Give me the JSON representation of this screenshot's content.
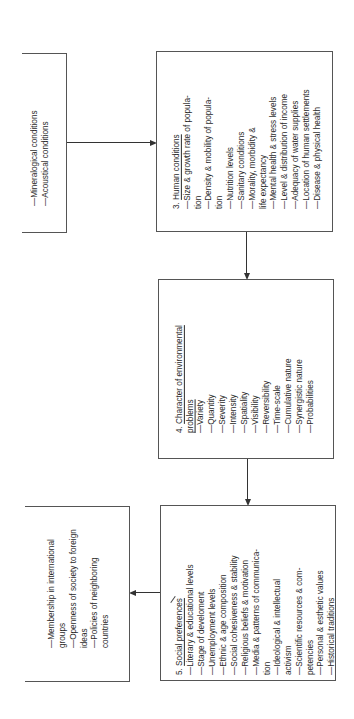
{
  "diagram": {
    "box_top_left": {
      "items": [
        "Mineralogical conditions",
        "Acoustical conditions"
      ]
    },
    "box3": {
      "number": "3.",
      "title": "Human conditions",
      "lines": [
        {
          "dash": true,
          "text": "Size & growth rate of popula-"
        },
        {
          "dash": false,
          "text": "tion"
        },
        {
          "dash": true,
          "text": "Density & mobility of popula-"
        },
        {
          "dash": false,
          "text": "tion"
        },
        {
          "dash": true,
          "text": "Nutrition levels"
        },
        {
          "dash": true,
          "text": "Sanitary conditions"
        },
        {
          "dash": true,
          "text": "Morality, morbidity &"
        },
        {
          "dash": false,
          "text": "life expectancy"
        },
        {
          "dash": true,
          "text": "Mental health & stress levels"
        },
        {
          "dash": true,
          "text": "Level & distribution of income"
        },
        {
          "dash": true,
          "text": "Adequacy of water supplies"
        },
        {
          "dash": true,
          "text": "Location of human settlements"
        },
        {
          "dash": true,
          "text": "Disease & physical health"
        }
      ]
    },
    "box4": {
      "number": "4.",
      "title_line1": "Character of environmental",
      "title_line2": "problems",
      "lines": [
        "Variety",
        "Quantity",
        "Severity",
        "Intensity",
        "Spatiality",
        "Visibility",
        "Reversibility",
        "Time-scale",
        "Cumulative nature",
        "Synergistic nature",
        "Probabilities"
      ]
    },
    "box5": {
      "number": "5.",
      "title": "Social preferences",
      "lines": [
        {
          "dash": true,
          "text": "Literary & educational levels"
        },
        {
          "dash": true,
          "text": "Stage of develoment"
        },
        {
          "dash": true,
          "text": "Unemployment levels"
        },
        {
          "dash": true,
          "text": "Ethnic & age composition"
        },
        {
          "dash": true,
          "text": "Social cohesiveness & stability"
        },
        {
          "dash": true,
          "text": "Religious beliefs & motivation"
        },
        {
          "dash": true,
          "text": "Media & patterns of communica-"
        },
        {
          "dash": false,
          "text": "tion"
        },
        {
          "dash": true,
          "text": "Ideological & intellectual"
        },
        {
          "dash": false,
          "text": "activism"
        },
        {
          "dash": true,
          "text": "Scientific resources & com-"
        },
        {
          "dash": false,
          "text": "petencies"
        },
        {
          "dash": true,
          "text": "Personal & esthetic values"
        },
        {
          "dash": true,
          "text": "Historical traditions"
        }
      ]
    },
    "box_bottom_left": {
      "lines": [
        {
          "dash": true,
          "text": "Membership in international"
        },
        {
          "dash": false,
          "text": "groups"
        },
        {
          "dash": true,
          "text": "Openness of society to foreign"
        },
        {
          "dash": false,
          "text": "ideas"
        },
        {
          "dash": true,
          "text": "Policies of neighboring"
        },
        {
          "dash": false,
          "text": "countries"
        }
      ]
    },
    "dash_glyph": "—"
  }
}
